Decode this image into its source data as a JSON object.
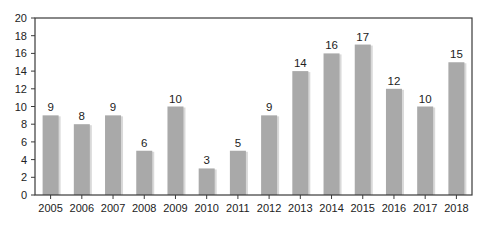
{
  "chart_data": {
    "type": "bar",
    "title": "",
    "xlabel": "",
    "ylabel": "",
    "ylim": [
      0,
      20
    ],
    "yticks": [
      0,
      2,
      4,
      6,
      8,
      10,
      12,
      14,
      16,
      18,
      20
    ],
    "grid": false,
    "legend": null,
    "categories": [
      "2005",
      "2006",
      "2007",
      "2008",
      "2009",
      "2010",
      "2011",
      "2012",
      "2013",
      "2014",
      "2015",
      "2016",
      "2017",
      "2018"
    ],
    "values": [
      9,
      8,
      9,
      5,
      10,
      3,
      5,
      9,
      14,
      16,
      17,
      12,
      10,
      15
    ],
    "data_labels": [
      "9",
      "8",
      "9",
      "6",
      "10",
      "3",
      "5",
      "9",
      "14",
      "16",
      "17",
      "12",
      "10",
      "15"
    ],
    "note": "2008 bar is drawn at height 5 but labeled 6 in the original figure"
  },
  "colors": {
    "bar": "#a9a9a9",
    "bar_shadow": "#d9d9d9",
    "axis": "#3a3a3a",
    "text": "#222222",
    "background": "#ffffff"
  }
}
